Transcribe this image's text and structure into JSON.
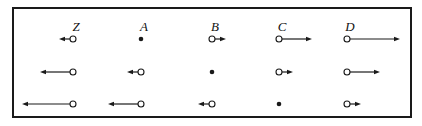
{
  "diagram": {
    "title": "",
    "columns": [
      {
        "label": "Z",
        "x": 73
      },
      {
        "label": "A",
        "x": 141
      },
      {
        "label": "B",
        "x": 212
      },
      {
        "label": "C",
        "x": 279
      },
      {
        "label": "D",
        "x": 347
      }
    ],
    "rows": [
      {
        "y": 39,
        "items": [
          {
            "type": "arrow",
            "direction": "left",
            "length": 14
          },
          {
            "type": "dot"
          },
          {
            "type": "arrow",
            "direction": "right",
            "length": 14
          },
          {
            "type": "arrow",
            "direction": "right",
            "length": 33
          },
          {
            "type": "arrow",
            "direction": "right",
            "length": 53
          }
        ]
      },
      {
        "y": 72,
        "items": [
          {
            "type": "arrow",
            "direction": "left",
            "length": 33
          },
          {
            "type": "arrow",
            "direction": "left",
            "length": 14
          },
          {
            "type": "dot"
          },
          {
            "type": "arrow",
            "direction": "right",
            "length": 14
          },
          {
            "type": "arrow",
            "direction": "right",
            "length": 33
          }
        ]
      },
      {
        "y": 104,
        "items": [
          {
            "type": "arrow",
            "direction": "left",
            "length": 51
          },
          {
            "type": "arrow",
            "direction": "left",
            "length": 33
          },
          {
            "type": "arrow",
            "direction": "left",
            "length": 14
          },
          {
            "type": "dot"
          },
          {
            "type": "arrow",
            "direction": "right",
            "length": 14
          }
        ]
      }
    ],
    "colors": {
      "stroke": "#1a1a1a",
      "background": "#ffffff"
    }
  }
}
